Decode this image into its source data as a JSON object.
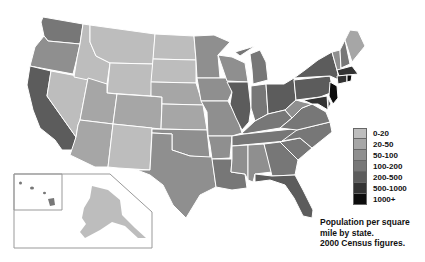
{
  "legend": {
    "items": [
      {
        "label": "0-20",
        "color": "#bdbdbd"
      },
      {
        "label": "20-50",
        "color": "#a6a6a6"
      },
      {
        "label": "50-100",
        "color": "#8f8f8f"
      },
      {
        "label": "100-200",
        "color": "#777777"
      },
      {
        "label": "200-500",
        "color": "#5c5c5c"
      },
      {
        "label": "500-1000",
        "color": "#333333"
      },
      {
        "label": "1000+",
        "color": "#0d0d0d"
      }
    ]
  },
  "caption": {
    "line1": "Population per square",
    "line2": "mile by state.",
    "line3": "2000 Census figures."
  },
  "states": {
    "WA": "50-100",
    "OR": "20-50",
    "CA": "200-500",
    "NV": "0-20",
    "ID": "0-20",
    "MT": "0-20",
    "WY": "0-20",
    "UT": "20-50",
    "CO": "20-50",
    "AZ": "20-50",
    "NM": "0-20",
    "ND": "0-20",
    "SD": "0-20",
    "NE": "20-50",
    "KS": "20-50",
    "OK": "50-100",
    "TX": "50-100",
    "MN": "50-100",
    "IA": "50-100",
    "MO": "50-100",
    "AR": "50-100",
    "LA": "100-200",
    "WI": "50-100",
    "IL": "200-500",
    "MI": "100-200",
    "IN": "100-200",
    "OH": "200-500",
    "KY": "100-200",
    "TN": "100-200",
    "MS": "50-100",
    "AL": "50-100",
    "GA": "100-200",
    "FL": "200-500",
    "SC": "100-200",
    "NC": "100-200",
    "VA": "100-200",
    "WV": "50-100",
    "PA": "200-500",
    "NY": "200-500",
    "VT": "50-100",
    "NH": "100-200",
    "ME": "20-50",
    "MA": "500-1000",
    "CT": "500-1000",
    "RI": "1000+",
    "NJ": "1000+",
    "DE": "200-500",
    "MD": "500-1000",
    "AK": "0-20",
    "HI": "100-200"
  }
}
